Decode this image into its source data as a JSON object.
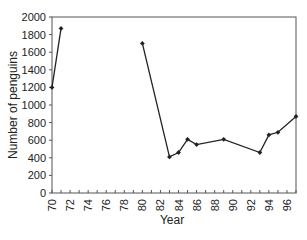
{
  "chart_data": {
    "type": "line",
    "title": "",
    "xlabel": "Year",
    "ylabel": "Number of penguins",
    "xlim": [
      70,
      97
    ],
    "ylim": [
      0,
      2000
    ],
    "grid": false,
    "legend": null,
    "x_ticks": [
      "70",
      "72",
      "74",
      "76",
      "78",
      "80",
      "82",
      "84",
      "86",
      "88",
      "90",
      "92",
      "94",
      "96"
    ],
    "y_ticks": [
      "0",
      "200",
      "400",
      "600",
      "800",
      "1000",
      "1200",
      "1400",
      "1600",
      "1800",
      "2000"
    ],
    "series": [
      {
        "name": "Penguins",
        "segments": [
          {
            "x": [
              70,
              71
            ],
            "y": [
              1200,
              1870
            ]
          },
          {
            "x": [
              80,
              83,
              84,
              85,
              86,
              89,
              93,
              94,
              95,
              97
            ],
            "y": [
              1700,
              410,
              460,
              610,
              550,
              610,
              460,
              660,
              690,
              870
            ]
          }
        ],
        "color": "#222222",
        "marker": "diamond"
      }
    ]
  }
}
